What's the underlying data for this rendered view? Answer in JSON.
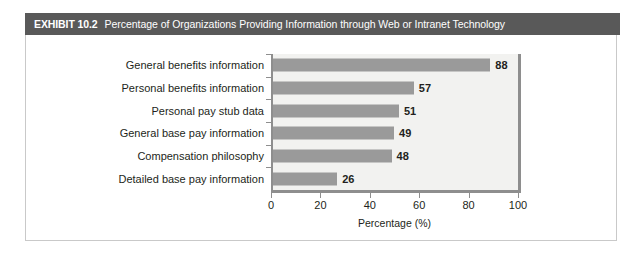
{
  "exhibit": {
    "label": "EXHIBIT 10.2",
    "title": "Percentage of Organizations Providing Information through Web or Intranet Technology",
    "header_bg": "#595959",
    "header_text_color": "#ffffff",
    "frame_border_color": "#c9c9c9"
  },
  "chart_data": {
    "type": "bar",
    "orientation": "horizontal",
    "title": "Percentage of Organizations Providing Information through Web or Intranet Technology",
    "categories": [
      "General benefits information",
      "Personal benefits information",
      "Personal pay stub data",
      "General base pay information",
      "Compensation philosophy",
      "Detailed base pay information"
    ],
    "values": [
      88,
      57,
      51,
      49,
      48,
      26
    ],
    "data_labels": [
      "88",
      "57",
      "51",
      "49",
      "48",
      "26"
    ],
    "xlabel": "Percentage (%)",
    "ylabel": "",
    "xlim": [
      0,
      100
    ],
    "xticks": [
      0,
      20,
      40,
      60,
      80,
      100
    ],
    "xtick_labels": [
      "0",
      "20",
      "40",
      "60",
      "80",
      "100"
    ],
    "grid": false,
    "legend": null,
    "bar_color": "#9a9a9a",
    "plot_bg": "#f2f2f0",
    "axis_color": "#8e8e8e"
  }
}
